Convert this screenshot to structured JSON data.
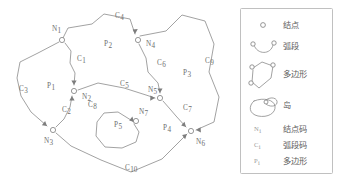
{
  "figure": {
    "title": "",
    "type": "gis-topology-vector-diagram",
    "colors": {
      "stroke": "#8a8a8a",
      "text": "#6e6e6e",
      "legend_border": "#b9b9b9",
      "background": "#ffffff"
    },
    "nodes": [
      {
        "id": "N1",
        "base": "N",
        "sub": "1",
        "label_x": 52,
        "label_y": 31,
        "dot_x": 62,
        "dot_y": 40
      },
      {
        "id": "N2",
        "base": "N",
        "sub": "2",
        "label_x": 82,
        "label_y": 99,
        "dot_x": 74,
        "dot_y": 91
      },
      {
        "id": "N3",
        "base": "N",
        "sub": "3",
        "label_x": 44,
        "label_y": 143,
        "dot_x": 53,
        "dot_y": 130
      },
      {
        "id": "N4",
        "base": "N",
        "sub": "4",
        "label_x": 146,
        "label_y": 46,
        "dot_x": 138,
        "dot_y": 40
      },
      {
        "id": "N5",
        "base": "N",
        "sub": "5",
        "label_x": 148,
        "label_y": 92,
        "dot_x": 160,
        "dot_y": 98
      },
      {
        "id": "N6",
        "base": "N",
        "sub": "6",
        "label_x": 196,
        "label_y": 144,
        "dot_x": 191,
        "dot_y": 131
      },
      {
        "id": "N7",
        "base": "N",
        "sub": "7",
        "label_x": 139,
        "label_y": 114,
        "dot_x": 136,
        "dot_y": 121
      }
    ],
    "arcs": [
      {
        "id": "C1",
        "base": "C",
        "sub": "1",
        "label_x": 77,
        "label_y": 61
      },
      {
        "id": "C2",
        "base": "C",
        "sub": "2",
        "label_x": 62,
        "label_y": 112
      },
      {
        "id": "C3",
        "base": "C",
        "sub": "3",
        "label_x": 19,
        "label_y": 91
      },
      {
        "id": "C4",
        "base": "C",
        "sub": "4",
        "label_x": 115,
        "label_y": 18
      },
      {
        "id": "C5",
        "base": "C",
        "sub": "5",
        "label_x": 120,
        "label_y": 86
      },
      {
        "id": "C6",
        "base": "C",
        "sub": "6",
        "label_x": 157,
        "label_y": 65
      },
      {
        "id": "C7",
        "base": "C",
        "sub": "7",
        "label_x": 183,
        "label_y": 110
      },
      {
        "id": "C8",
        "base": "C",
        "sub": "8",
        "label_x": 88,
        "label_y": 107
      },
      {
        "id": "C9",
        "base": "C",
        "sub": "9",
        "label_x": 205,
        "label_y": 63
      },
      {
        "id": "C10",
        "base": "C",
        "sub": "10",
        "label_x": 125,
        "label_y": 170
      }
    ],
    "polygons": [
      {
        "id": "P1",
        "base": "P",
        "sub": "1",
        "label_x": 47,
        "label_y": 88
      },
      {
        "id": "P2",
        "base": "P",
        "sub": "2",
        "label_x": 104,
        "label_y": 46
      },
      {
        "id": "P3",
        "base": "P",
        "sub": "3",
        "label_x": 183,
        "label_y": 75
      },
      {
        "id": "P4",
        "base": "P",
        "sub": "4",
        "label_x": 163,
        "label_y": 130
      },
      {
        "id": "P5",
        "base": "P",
        "sub": "5",
        "label_x": 114,
        "label_y": 127
      }
    ]
  },
  "legend": {
    "items": [
      {
        "symbol": "node-circle-symbol",
        "label": "结点",
        "sym_base": "",
        "sym_sub": ""
      },
      {
        "symbol": "arc-segment-symbol",
        "label": "弧段",
        "sym_base": "",
        "sym_sub": ""
      },
      {
        "symbol": "polygon-symbol",
        "label": "多边形",
        "sym_base": "",
        "sym_sub": ""
      },
      {
        "symbol": "island-symbol",
        "label": "岛",
        "sym_base": "",
        "sym_sub": ""
      },
      {
        "symbol": "node-code-symbol",
        "label": "结点码",
        "sym_base": "N",
        "sym_sub": "i"
      },
      {
        "symbol": "arc-code-symbol",
        "label": "弧段码",
        "sym_base": "C",
        "sym_sub": "i"
      },
      {
        "symbol": "polygon-code-symbol",
        "label": "多边形",
        "sym_base": "P",
        "sym_sub": "i"
      }
    ]
  }
}
